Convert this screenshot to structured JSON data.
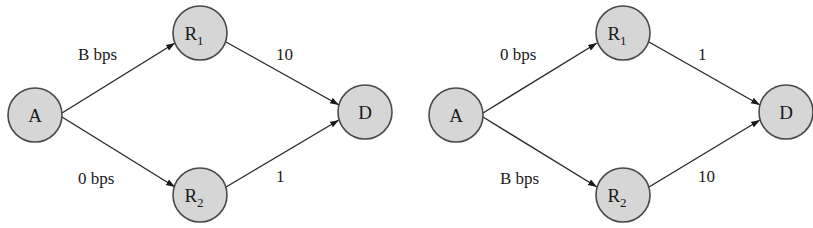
{
  "diagrams": [
    {
      "name": "left",
      "nodes": {
        "A": {
          "label": "A",
          "x": 35,
          "y": 115
        },
        "R1": {
          "label": "R",
          "sub": "1",
          "x": 200,
          "y": 33
        },
        "R2": {
          "label": "R",
          "sub": "2",
          "x": 200,
          "y": 195
        },
        "D": {
          "label": "D",
          "x": 365,
          "y": 112
        }
      },
      "edges": {
        "A_R1": {
          "label": "B bps"
        },
        "A_R2": {
          "label": "0 bps"
        },
        "R1_D": {
          "label": "10"
        },
        "R2_D": {
          "label": "1"
        }
      }
    },
    {
      "name": "right",
      "nodes": {
        "A": {
          "label": "A",
          "x": 456,
          "y": 115
        },
        "R1": {
          "label": "R",
          "sub": "1",
          "x": 623,
          "y": 33
        },
        "R2": {
          "label": "R",
          "sub": "2",
          "x": 623,
          "y": 195
        },
        "D": {
          "label": "D",
          "x": 786,
          "y": 112
        }
      },
      "edges": {
        "A_R1": {
          "label": "0 bps"
        },
        "A_R2": {
          "label": "B bps"
        },
        "R1_D": {
          "label": "1"
        },
        "R2_D": {
          "label": "10"
        }
      }
    }
  ],
  "colors": {
    "node_fill": "#d6d6d6",
    "node_stroke": "#4a4a4a",
    "edge": "#2a2a2a"
  }
}
